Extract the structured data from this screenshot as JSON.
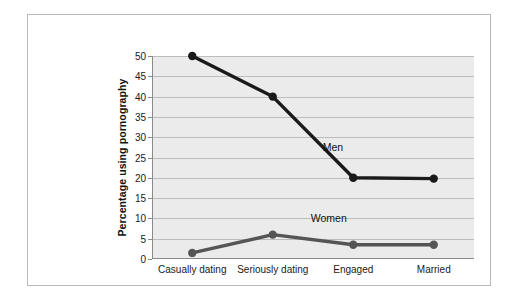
{
  "chart_data": {
    "type": "line",
    "title": "",
    "xlabel": "",
    "ylabel": "Percentage using pornography",
    "categories": [
      "Casually dating",
      "Seriously dating",
      "Engaged",
      "Married"
    ],
    "ylim": [
      0,
      50
    ],
    "yticks": [
      0,
      5,
      10,
      15,
      20,
      25,
      30,
      35,
      40,
      45,
      50
    ],
    "grid": true,
    "legend": "inline-labels",
    "series": [
      {
        "name": "Men",
        "values": [
          50,
          40,
          20,
          19.8
        ],
        "color": "#1a1a1a"
      },
      {
        "name": "Women",
        "values": [
          1.5,
          6,
          3.5,
          3.5
        ],
        "color": "#555555"
      }
    ]
  },
  "axis": {
    "y_title": "Percentage using pornography",
    "y_tick_labels": [
      "0",
      "5",
      "10",
      "15",
      "20",
      "25",
      "30",
      "35",
      "40",
      "45",
      "50"
    ],
    "x_tick_labels": [
      "Casually dating",
      "Seriously dating",
      "Engaged",
      "Married"
    ]
  },
  "annotations": {
    "men_label": "Men",
    "women_label": "Women"
  },
  "colors": {
    "men_line": "#1a1a1a",
    "women_line": "#555555",
    "plot_background": "#ebebeb",
    "gridline": "#bdbdbd",
    "axis": "#8a8a8a",
    "frame_border": "#b9b9b9",
    "page_background": "#ffffff"
  }
}
